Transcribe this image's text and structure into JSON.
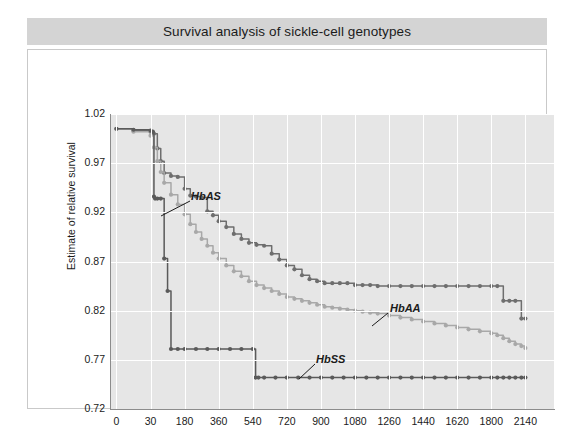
{
  "title": "Survival analysis of sickle-cell genotypes",
  "axis": {
    "xlabel": "Time until death (days)",
    "ylabel": "Estimate of relative survival"
  },
  "annotations": [
    {
      "name": "HbAS",
      "label": "HbAS"
    },
    {
      "name": "HbAA",
      "label": "HbAA"
    },
    {
      "name": "HbSS",
      "label": "HbSS"
    }
  ],
  "colors": {
    "title_banner": "#d4d4d4",
    "plot_background": "#e6e6e6",
    "gridline": "#ffffff",
    "axis": "#8c8c8c",
    "hbas": "#6e6e6e",
    "hbaa": "#a8a8a8",
    "hbss": "#5a5a5a",
    "text": "#1b1b1b"
  },
  "chart_data": {
    "type": "line",
    "title": "Survival analysis of sickle-cell genotypes",
    "xlabel": "Time until death (days)",
    "ylabel": "Estimate of relative survival",
    "grid": true,
    "legend": "annotated-inline",
    "step": true,
    "markers": true,
    "ylim": [
      0.72,
      1.02
    ],
    "yticks": [
      "1.02",
      "0.97",
      "0.92",
      "0.87",
      "0.82",
      "0.77",
      "0.72"
    ],
    "ytick_values": [
      1.02,
      0.97,
      0.92,
      0.87,
      0.82,
      0.77,
      0.72
    ],
    "xticks": [
      "0",
      "30",
      "180",
      "360",
      "540",
      "720",
      "900",
      "1080",
      "1260",
      "1440",
      "1620",
      "1800",
      "2140"
    ],
    "xtick_values": [
      0,
      30,
      180,
      360,
      540,
      720,
      900,
      1080,
      1260,
      1440,
      1620,
      1800,
      2140
    ],
    "xaxis_note": "tick labels are evenly spaced (ordinal positions), not linearly scaled",
    "series": [
      {
        "name": "HbAS",
        "color": "#6e6e6e",
        "x": [
          0,
          15,
          30,
          45,
          60,
          75,
          90,
          120,
          150,
          180,
          210,
          240,
          270,
          300,
          330,
          360,
          400,
          440,
          480,
          520,
          560,
          600,
          640,
          680,
          720,
          760,
          800,
          840,
          880,
          920,
          960,
          1000,
          1040,
          1080,
          1120,
          1160,
          1200,
          1260,
          1320,
          1380,
          1440,
          1500,
          1560,
          1620,
          1680,
          1740,
          1800,
          1860,
          1920,
          1980,
          2040,
          2100,
          2140
        ],
        "values": [
          1.005,
          1.003,
          1.002,
          1.0,
          0.985,
          0.972,
          0.96,
          0.957,
          0.956,
          0.944,
          0.937,
          0.936,
          0.935,
          0.921,
          0.917,
          0.911,
          0.905,
          0.898,
          0.893,
          0.889,
          0.887,
          0.886,
          0.878,
          0.872,
          0.866,
          0.862,
          0.856,
          0.852,
          0.85,
          0.848,
          0.848,
          0.848,
          0.848,
          0.846,
          0.846,
          0.846,
          0.845,
          0.845,
          0.845,
          0.845,
          0.845,
          0.845,
          0.845,
          0.845,
          0.845,
          0.845,
          0.845,
          0.845,
          0.83,
          0.83,
          0.83,
          0.812,
          0.812
        ]
      },
      {
        "name": "HbAA",
        "color": "#a8a8a8",
        "x": [
          0,
          15,
          30,
          45,
          60,
          75,
          90,
          120,
          150,
          180,
          210,
          240,
          270,
          300,
          330,
          360,
          400,
          440,
          480,
          520,
          560,
          600,
          640,
          680,
          720,
          760,
          800,
          840,
          880,
          920,
          960,
          1000,
          1040,
          1080,
          1120,
          1160,
          1200,
          1260,
          1320,
          1380,
          1440,
          1500,
          1560,
          1620,
          1680,
          1740,
          1800,
          1860,
          1920,
          1980,
          2040,
          2100,
          2140
        ],
        "values": [
          1.005,
          1.002,
          0.998,
          0.986,
          0.972,
          0.961,
          0.95,
          0.938,
          0.928,
          0.918,
          0.908,
          0.9,
          0.893,
          0.886,
          0.879,
          0.873,
          0.866,
          0.86,
          0.855,
          0.85,
          0.846,
          0.843,
          0.84,
          0.837,
          0.834,
          0.832,
          0.83,
          0.828,
          0.826,
          0.824,
          0.823,
          0.822,
          0.821,
          0.82,
          0.819,
          0.818,
          0.817,
          0.815,
          0.813,
          0.811,
          0.809,
          0.807,
          0.805,
          0.803,
          0.801,
          0.799,
          0.797,
          0.795,
          0.792,
          0.789,
          0.786,
          0.784,
          0.782
        ]
      },
      {
        "name": "HbSS",
        "color": "#5a5a5a",
        "x": [
          0,
          15,
          30,
          40,
          45,
          50,
          60,
          75,
          90,
          105,
          120,
          150,
          180,
          240,
          300,
          360,
          420,
          480,
          540,
          555,
          570,
          600,
          660,
          720,
          780,
          840,
          900,
          960,
          1020,
          1080,
          1140,
          1200,
          1260,
          1320,
          1380,
          1440,
          1500,
          1560,
          1620,
          1680,
          1740,
          1800,
          1860,
          1920,
          1980,
          2040,
          2100,
          2140
        ],
        "values": [
          1.005,
          1.004,
          1.003,
          1.002,
          0.936,
          0.934,
          0.934,
          0.934,
          0.873,
          0.84,
          0.781,
          0.781,
          0.781,
          0.781,
          0.781,
          0.781,
          0.781,
          0.781,
          0.781,
          0.752,
          0.752,
          0.752,
          0.752,
          0.752,
          0.752,
          0.752,
          0.752,
          0.752,
          0.752,
          0.752,
          0.752,
          0.752,
          0.752,
          0.752,
          0.752,
          0.752,
          0.752,
          0.752,
          0.752,
          0.752,
          0.752,
          0.752,
          0.752,
          0.752,
          0.752,
          0.752,
          0.752,
          0.752
        ]
      }
    ]
  }
}
